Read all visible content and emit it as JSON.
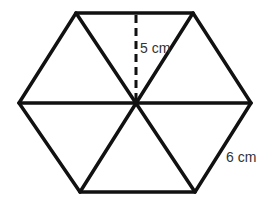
{
  "diagram": {
    "colors": {
      "stroke": "#111111",
      "text": "#333333",
      "background": "#ffffff"
    },
    "vertices": [
      {
        "name": "top-left",
        "x": 76,
        "y": 13
      },
      {
        "name": "top-right",
        "x": 193,
        "y": 13
      },
      {
        "name": "right",
        "x": 251,
        "y": 103
      },
      {
        "name": "bottom-right",
        "x": 195,
        "y": 192
      },
      {
        "name": "bottom-left",
        "x": 80,
        "y": 192
      },
      {
        "name": "left",
        "x": 19,
        "y": 103
      }
    ],
    "center": {
      "x": 136,
      "y": 103
    },
    "labels": {
      "apothem": "5 cm",
      "side": "6 cm"
    }
  }
}
